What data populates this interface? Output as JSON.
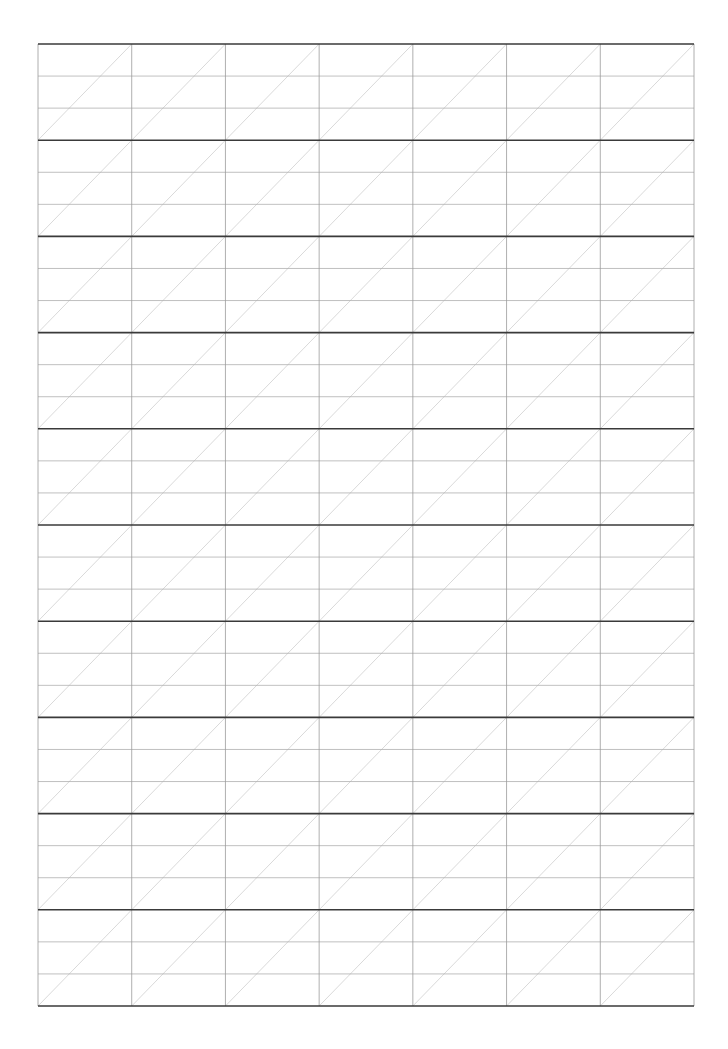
{
  "page": {
    "type": "handwriting-practice-sheet",
    "background_color": "#ffffff"
  },
  "grid": {
    "left": 38,
    "top": 44,
    "right": 694,
    "bottom": 1006,
    "columns": 7,
    "rows": 10,
    "bands_per_row": 3,
    "cell_diagonal": "bottom-left-to-top-right",
    "colors": {
      "row_border": "#3a3a3a",
      "column_line": "#9a9a9a",
      "band_line": "#b0b0b0",
      "diagonal": "#cfcfcf"
    },
    "stroke_widths": {
      "row_border": 1.6,
      "column_line": 0.8,
      "band_line": 0.8,
      "diagonal": 0.8
    }
  }
}
